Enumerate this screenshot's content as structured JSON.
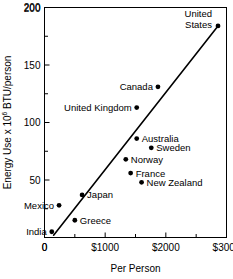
{
  "chart_data": {
    "type": "scatter",
    "title": "",
    "xlabel": "Per Person",
    "ylabel": "Energy Use x 10⁶ BTU/person",
    "ylabel_parts": {
      "pre": "Energy Use x 10",
      "sup": "6",
      "post": " BTU/person"
    },
    "xlim": [
      0,
      3000
    ],
    "ylim": [
      0,
      200
    ],
    "grid": false,
    "legend": "none",
    "x_ticks": [
      0,
      500,
      1000,
      1500,
      2000,
      2500,
      3000
    ],
    "x_tick_labels": [
      "0",
      "",
      "$1000",
      "",
      "$2000",
      "",
      "$3000"
    ],
    "y_ticks": [
      0,
      25,
      50,
      75,
      100,
      125,
      150,
      175,
      200
    ],
    "y_tick_labels": [
      "",
      "",
      "50",
      "",
      "100",
      "",
      "150",
      "",
      "200"
    ],
    "points": [
      {
        "name": "India",
        "x": 120,
        "y": 5,
        "label_pos": "left",
        "label": "India"
      },
      {
        "name": "Mexico",
        "x": 240,
        "y": 28,
        "label_pos": "left",
        "label": "Mexico"
      },
      {
        "name": "Greece",
        "x": 500,
        "y": 15,
        "label_pos": "right",
        "label": "Greece"
      },
      {
        "name": "Japan",
        "x": 620,
        "y": 37,
        "label_pos": "right",
        "label": "Japan"
      },
      {
        "name": "France",
        "x": 1420,
        "y": 56,
        "label_pos": "right",
        "label": "France"
      },
      {
        "name": "New Zealand",
        "x": 1600,
        "y": 48,
        "label_pos": "right",
        "label": "New Zealand"
      },
      {
        "name": "Norway",
        "x": 1340,
        "y": 68,
        "label_pos": "right",
        "label": "Norway"
      },
      {
        "name": "Sweden",
        "x": 1760,
        "y": 78,
        "label_pos": "right",
        "label": "Sweden"
      },
      {
        "name": "Australia",
        "x": 1520,
        "y": 86,
        "label_pos": "right",
        "label": "Australia"
      },
      {
        "name": "United Kingdom",
        "x": 1520,
        "y": 113,
        "label_pos": "left",
        "label": "United Kingdom"
      },
      {
        "name": "Canada",
        "x": 1870,
        "y": 131,
        "label_pos": "left",
        "label": "Canada"
      },
      {
        "name": "United States",
        "x": 2860,
        "y": 184,
        "label_pos": "left-stack",
        "label": "United States",
        "label_line1": "United",
        "label_line2": "States"
      }
    ],
    "trendline": {
      "x0": 150,
      "y0": 2,
      "x1": 2860,
      "y1": 184
    }
  },
  "colors": {
    "axis": "#000000",
    "marker": "#000000",
    "line": "#000000",
    "background": "#ffffff"
  }
}
